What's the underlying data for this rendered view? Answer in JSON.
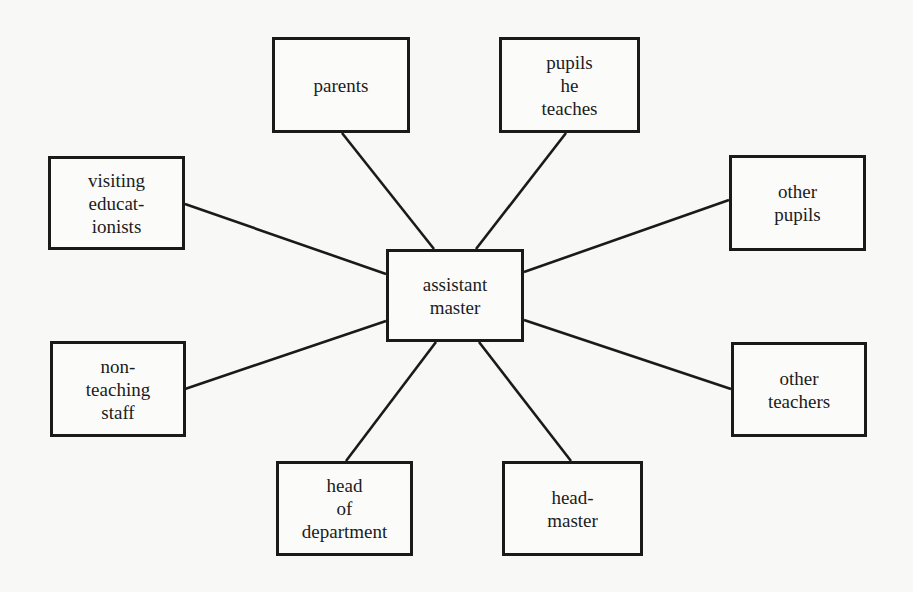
{
  "diagram": {
    "type": "hub-and-spoke",
    "center": {
      "id": "assistant-master",
      "lines": [
        "assistant",
        "master"
      ],
      "box": [
        386,
        249,
        138,
        93
      ]
    },
    "nodes": [
      {
        "id": "parents",
        "lines": [
          "parents"
        ],
        "box": [
          272,
          37,
          138,
          96
        ],
        "link": [
          342,
          133,
          434,
          249
        ]
      },
      {
        "id": "pupils-he-teaches",
        "lines": [
          "pupils",
          "he",
          "teaches"
        ],
        "box": [
          499,
          37,
          141,
          96
        ],
        "link": [
          566,
          133,
          476,
          249
        ]
      },
      {
        "id": "visiting-educationists",
        "lines": [
          "visiting",
          "educat-",
          "ionists"
        ],
        "box": [
          48,
          156,
          137,
          94
        ],
        "link": [
          185,
          204,
          386,
          274
        ]
      },
      {
        "id": "other-pupils",
        "lines": [
          "other",
          "pupils"
        ],
        "box": [
          729,
          155,
          137,
          96
        ],
        "link": [
          729,
          200,
          524,
          272
        ]
      },
      {
        "id": "non-teaching-staff",
        "lines": [
          "non-",
          "teaching",
          "staff"
        ],
        "box": [
          50,
          341,
          136,
          96
        ],
        "link": [
          185,
          389,
          386,
          321
        ]
      },
      {
        "id": "other-teachers",
        "lines": [
          "other",
          "teachers"
        ],
        "box": [
          731,
          342,
          136,
          95
        ],
        "link": [
          731,
          389,
          524,
          320
        ]
      },
      {
        "id": "head-of-department",
        "lines": [
          "head",
          "of",
          "department"
        ],
        "box": [
          276,
          461,
          137,
          95
        ],
        "link": [
          346,
          461,
          436,
          342
        ]
      },
      {
        "id": "headmaster",
        "lines": [
          "head-",
          "master"
        ],
        "box": [
          502,
          461,
          141,
          95
        ],
        "link": [
          571,
          461,
          479,
          342
        ]
      }
    ],
    "colors": {
      "line": "#1a1a1a",
      "background": "#f8f8f6"
    }
  }
}
